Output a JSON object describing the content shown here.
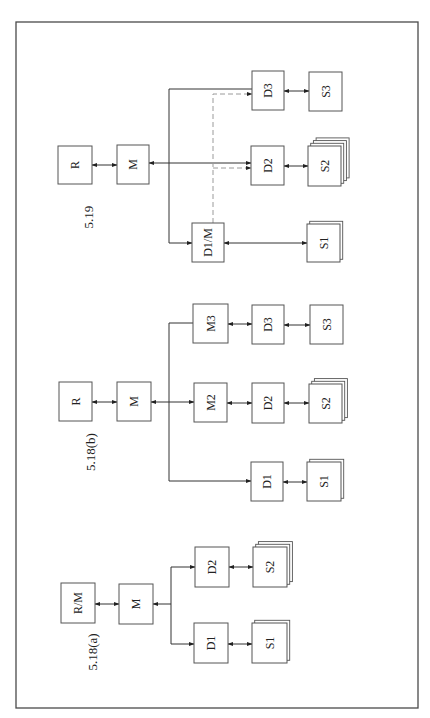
{
  "figures": [
    {
      "id": "fig-5-19",
      "caption": "5.19",
      "caption_pos": [
        88,
        217
      ],
      "boxes": [
        {
          "id": "R",
          "label": "R",
          "x": 58,
          "y": 146,
          "w": 34,
          "h": 38
        },
        {
          "id": "M",
          "label": "M",
          "x": 117,
          "y": 145,
          "w": 32,
          "h": 39
        },
        {
          "id": "D3",
          "label": "D3",
          "x": 252,
          "y": 71,
          "w": 32,
          "h": 39
        },
        {
          "id": "S3",
          "label": "S3",
          "x": 309,
          "y": 72,
          "w": 33,
          "h": 39,
          "sheets": 1
        },
        {
          "id": "D2",
          "label": "D2",
          "x": 251,
          "y": 146,
          "w": 33,
          "h": 39
        },
        {
          "id": "S2",
          "label": "S2",
          "x": 308,
          "y": 146,
          "w": 33,
          "h": 40,
          "sheets": 4
        },
        {
          "id": "D1M",
          "label": "D1/M",
          "x": 192,
          "y": 223,
          "w": 32,
          "h": 39
        },
        {
          "id": "S1",
          "label": "S1",
          "x": 307,
          "y": 224,
          "w": 33,
          "h": 38,
          "sheets": 2
        }
      ],
      "lines": [
        {
          "type": "solid",
          "pts": [
            [
              92,
              165
            ],
            [
              117,
              165
            ]
          ],
          "start": true,
          "end": true
        },
        {
          "type": "solid",
          "pts": [
            [
              149,
              163
            ],
            [
              251,
              163
            ]
          ],
          "start": true,
          "end": true
        },
        {
          "type": "solid",
          "pts": [
            [
              252,
              89
            ],
            [
              169,
              89
            ],
            [
              169,
              243
            ],
            [
              192,
              243
            ]
          ],
          "start": false,
          "end": true,
          "endFirst": true
        },
        {
          "type": "solid",
          "pts": [
            [
              284,
              91
            ],
            [
              309,
              91
            ]
          ],
          "start": true,
          "end": true
        },
        {
          "type": "solid",
          "pts": [
            [
              284,
              166
            ],
            [
              308,
              166
            ]
          ],
          "start": true,
          "end": true
        },
        {
          "type": "solid",
          "pts": [
            [
              224,
              243
            ],
            [
              307,
              243
            ]
          ],
          "start": true,
          "end": true
        },
        {
          "type": "dash",
          "pts": [
            [
              213,
              223
            ],
            [
              213,
              94
            ],
            [
              252,
              94
            ]
          ],
          "start": false,
          "end": true
        },
        {
          "type": "dash",
          "pts": [
            [
              213,
              168
            ],
            [
              251,
              168
            ]
          ],
          "start": false,
          "end": true
        }
      ]
    },
    {
      "id": "fig-5-18b",
      "caption": "5.18(b)",
      "caption_pos": [
        90,
        452
      ],
      "boxes": [
        {
          "id": "R",
          "label": "R",
          "x": 59,
          "y": 382,
          "w": 33,
          "h": 39
        },
        {
          "id": "M",
          "label": "M",
          "x": 117,
          "y": 382,
          "w": 34,
          "h": 39
        },
        {
          "id": "M3",
          "label": "M3",
          "x": 193,
          "y": 304,
          "w": 35,
          "h": 39
        },
        {
          "id": "D3",
          "label": "D3",
          "x": 252,
          "y": 305,
          "w": 32,
          "h": 39
        },
        {
          "id": "S3",
          "label": "S3",
          "x": 310,
          "y": 305,
          "w": 33,
          "h": 39,
          "sheets": 1
        },
        {
          "id": "M2",
          "label": "M2",
          "x": 194,
          "y": 383,
          "w": 33,
          "h": 39
        },
        {
          "id": "D2",
          "label": "D2",
          "x": 252,
          "y": 383,
          "w": 32,
          "h": 40
        },
        {
          "id": "S2",
          "label": "S2",
          "x": 309,
          "y": 384,
          "w": 33,
          "h": 39,
          "sheets": 3
        },
        {
          "id": "D1",
          "label": "D1",
          "x": 251,
          "y": 462,
          "w": 32,
          "h": 39
        },
        {
          "id": "S1",
          "label": "S1",
          "x": 307,
          "y": 462,
          "w": 34,
          "h": 39,
          "sheets": 2
        }
      ],
      "lines": [
        {
          "type": "solid",
          "pts": [
            [
              92,
              402
            ],
            [
              117,
              402
            ]
          ],
          "start": true,
          "end": true
        },
        {
          "type": "solid",
          "pts": [
            [
              151,
              402
            ],
            [
              194,
              402
            ]
          ],
          "start": true,
          "end": true
        },
        {
          "type": "solid",
          "pts": [
            [
              193,
              323
            ],
            [
              169,
              323
            ],
            [
              169,
              481
            ],
            [
              251,
              481
            ]
          ],
          "start": true,
          "end": true,
          "noStartHead": true
        },
        {
          "type": "solid",
          "pts": [
            [
              228,
              324
            ],
            [
              252,
              324
            ]
          ],
          "start": true,
          "end": true
        },
        {
          "type": "solid",
          "pts": [
            [
              284,
              325
            ],
            [
              310,
              325
            ]
          ],
          "start": true,
          "end": true
        },
        {
          "type": "solid",
          "pts": [
            [
              227,
              403
            ],
            [
              252,
              403
            ]
          ],
          "start": true,
          "end": true
        },
        {
          "type": "solid",
          "pts": [
            [
              284,
              403
            ],
            [
              309,
              403
            ]
          ],
          "start": true,
          "end": true
        },
        {
          "type": "solid",
          "pts": [
            [
              283,
              482
            ],
            [
              307,
              482
            ]
          ],
          "start": true,
          "end": true
        }
      ]
    },
    {
      "id": "fig-5-18a",
      "caption": "5.18(a)",
      "caption_pos": [
        92,
        652
      ],
      "boxes": [
        {
          "id": "RM",
          "label": "R/M",
          "x": 61,
          "y": 583,
          "w": 34,
          "h": 40
        },
        {
          "id": "M",
          "label": "M",
          "x": 119,
          "y": 584,
          "w": 34,
          "h": 40
        },
        {
          "id": "D2",
          "label": "D2",
          "x": 195,
          "y": 547,
          "w": 34,
          "h": 40
        },
        {
          "id": "S2",
          "label": "S2",
          "x": 253,
          "y": 547,
          "w": 34,
          "h": 40,
          "sheets": 3
        },
        {
          "id": "D1",
          "label": "D1",
          "x": 194,
          "y": 623,
          "w": 34,
          "h": 40
        },
        {
          "id": "S1",
          "label": "S1",
          "x": 252,
          "y": 623,
          "w": 35,
          "h": 40,
          "sheets": 2
        }
      ],
      "lines": [
        {
          "type": "solid",
          "pts": [
            [
              95,
              604
            ],
            [
              119,
              604
            ]
          ],
          "start": true,
          "end": true
        },
        {
          "type": "solid",
          "pts": [
            [
              153,
              604
            ],
            [
              171,
              604
            ]
          ],
          "start": true,
          "end": false
        },
        {
          "type": "solid",
          "pts": [
            [
              171,
              567
            ],
            [
              171,
              644
            ]
          ],
          "start": false,
          "end": false
        },
        {
          "type": "solid",
          "pts": [
            [
              171,
              567
            ],
            [
              195,
              567
            ]
          ],
          "start": false,
          "end": true
        },
        {
          "type": "solid",
          "pts": [
            [
              171,
              644
            ],
            [
              194,
              644
            ]
          ],
          "start": false,
          "end": true
        },
        {
          "type": "solid",
          "pts": [
            [
              229,
              567
            ],
            [
              253,
              567
            ]
          ],
          "start": true,
          "end": true
        },
        {
          "type": "solid",
          "pts": [
            [
              228,
              644
            ],
            [
              252,
              644
            ]
          ],
          "start": true,
          "end": true
        }
      ]
    }
  ],
  "frame": {
    "x": 16,
    "y": 22,
    "w": 402,
    "h": 686
  }
}
